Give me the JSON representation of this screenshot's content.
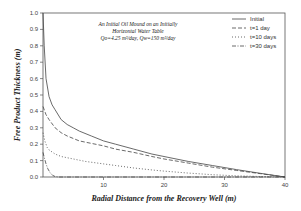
{
  "chart_data": {
    "type": "line",
    "title": "",
    "annotation": [
      "An Initial Oil Mound on an Initially",
      "Horizontal Water Table",
      "Qo=4.25 m³/day, Qw=150 m³/day"
    ],
    "xlabel": "Radial Distance from the Recovery Well (m)",
    "ylabel": "Free Product Thickness (m)",
    "xlim": [
      0,
      40
    ],
    "ylim": [
      0,
      1.0
    ],
    "xticks": [
      10,
      20,
      30,
      40
    ],
    "xtick_labels": [
      "10",
      "20",
      "30",
      "40"
    ],
    "yticks": [
      0.0,
      0.1,
      0.2,
      0.3,
      0.4,
      0.5,
      0.6,
      0.7,
      0.8,
      0.9,
      1.0
    ],
    "ytick_labels": [
      "0.0",
      "0.1",
      "0.2",
      "0.3",
      "0.4",
      "0.5",
      "0.6",
      "0.7",
      "0.8",
      "0.9",
      "1.0"
    ],
    "grid": false,
    "legend_position": "top-right",
    "series": [
      {
        "name": "Initial",
        "style": "solid",
        "x": [
          0,
          0.2,
          0.5,
          1.0,
          1.5,
          2,
          3,
          4,
          5,
          6,
          8,
          10,
          12,
          15,
          18,
          20,
          24,
          28,
          32,
          36,
          40
        ],
        "y": [
          1.0,
          0.8,
          0.6,
          0.49,
          0.44,
          0.41,
          0.35,
          0.32,
          0.3,
          0.28,
          0.25,
          0.22,
          0.2,
          0.17,
          0.14,
          0.125,
          0.095,
          0.07,
          0.045,
          0.022,
          0.0
        ]
      },
      {
        "name": "t=1  day",
        "style": "dashed",
        "x": [
          0,
          0.5,
          1,
          2,
          3,
          4,
          5,
          6,
          8,
          10,
          12,
          15,
          18,
          20,
          24,
          28,
          32,
          36,
          40
        ],
        "y": [
          0.43,
          0.38,
          0.35,
          0.3,
          0.27,
          0.25,
          0.235,
          0.22,
          0.205,
          0.19,
          0.17,
          0.15,
          0.125,
          0.11,
          0.085,
          0.06,
          0.04,
          0.02,
          0.0
        ]
      },
      {
        "name": "t=10  days",
        "style": "dotted",
        "x": [
          0,
          0.3,
          0.7,
          1,
          2,
          3,
          5,
          7,
          10,
          12,
          15,
          18,
          20,
          24,
          28,
          32,
          36,
          40
        ],
        "y": [
          0.27,
          0.22,
          0.18,
          0.165,
          0.14,
          0.125,
          0.11,
          0.095,
          0.08,
          0.07,
          0.055,
          0.043,
          0.036,
          0.024,
          0.014,
          0.007,
          0.003,
          0.0
        ]
      },
      {
        "name": "t=30  days",
        "style": "dash-dot",
        "x": [
          0,
          0.2,
          0.5,
          0.8,
          1.2,
          1.6,
          2.0,
          2.5,
          40
        ],
        "y": [
          0.15,
          0.12,
          0.08,
          0.05,
          0.025,
          0.01,
          0.003,
          0.0,
          0.0
        ]
      }
    ]
  }
}
